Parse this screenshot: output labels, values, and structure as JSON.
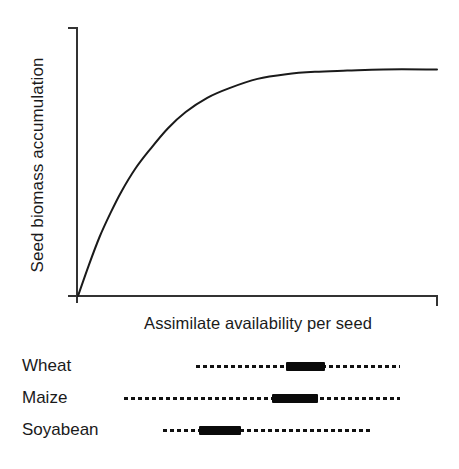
{
  "chart_data": {
    "type": "line",
    "title": "",
    "xlabel": "Assimilate availability per seed",
    "ylabel": "Seed biomass accumulation",
    "grid": false,
    "legend": false,
    "axis_ticks": "none",
    "xlim": [
      0,
      1
    ],
    "ylim": [
      0,
      1
    ],
    "series": [
      {
        "name": "seed-biomass-response",
        "x": [
          0.0,
          0.03,
          0.06,
          0.09,
          0.12,
          0.16,
          0.2,
          0.25,
          0.3,
          0.36,
          0.42,
          0.5,
          0.58,
          0.66,
          0.75,
          0.85,
          1.0
        ],
        "y": [
          0.0,
          0.13,
          0.25,
          0.35,
          0.44,
          0.54,
          0.62,
          0.71,
          0.78,
          0.84,
          0.88,
          0.92,
          0.94,
          0.95,
          0.955,
          0.96,
          0.96
        ]
      }
    ],
    "species_ranges": {
      "type": "range-bars",
      "axis_shared_with": "Assimilate availability per seed",
      "note": "Dashed lines show the range of assimilate availability per seed; thick black segments show the typical operating range for each crop.",
      "rows": [
        {
          "label": "Wheat",
          "line_start": 0.427,
          "line_end": 0.872,
          "bar_start": 0.623,
          "bar_end": 0.708
        },
        {
          "label": "Maize",
          "line_start": 0.27,
          "line_end": 0.872,
          "bar_start": 0.592,
          "bar_end": 0.693
        },
        {
          "label": "Soyabean",
          "line_start": 0.355,
          "line_end": 0.806,
          "bar_start": 0.433,
          "bar_end": 0.525
        }
      ]
    },
    "colors": {
      "curve": "#1a1a1a",
      "axis": "#333333",
      "bar": "#0a0a0a",
      "dash": "#111111",
      "background": "#ffffff"
    }
  },
  "chart": {
    "y_axis_title": "Seed biomass accumulation",
    "x_axis_title": "Assimilate availability per seed"
  },
  "species": {
    "rows": [
      {
        "label": "Wheat"
      },
      {
        "label": "Maize"
      },
      {
        "label": "Soyabean"
      }
    ]
  }
}
